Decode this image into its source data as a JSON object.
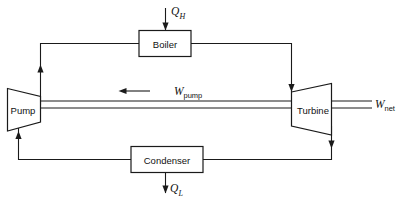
{
  "diagram": {
    "type": "thermodynamic-cycle-block-diagram",
    "background_color": "#ffffff",
    "line_color": "#1a1a1a"
  },
  "devices": {
    "boiler": {
      "label": "Boiler",
      "shape": "rectangle"
    },
    "turbine": {
      "label": "Turbine",
      "shape": "trapezoid-expanding-right"
    },
    "condenser": {
      "label": "Condenser",
      "shape": "rectangle"
    },
    "pump": {
      "label": "Pump",
      "shape": "trapezoid-narrowing-right"
    }
  },
  "flows": {
    "heat_in": {
      "symbol": "Q",
      "subscript": "H",
      "direction": "into-boiler-downward",
      "icon": "down-arrow-icon"
    },
    "heat_out": {
      "symbol": "Q",
      "subscript": "L",
      "direction": "out-of-condenser-downward",
      "icon": "down-arrow-icon"
    },
    "work_pump": {
      "symbol": "W",
      "subscript": "pump",
      "direction": "leftward-into-pump",
      "icon": "left-arrow-icon"
    },
    "work_net": {
      "symbol": "W",
      "subscript": "net",
      "direction": "rightward-out-of-turbine",
      "icon": "shaft-line-icon"
    }
  },
  "piping": {
    "pump_to_boiler": {
      "name": "feedwater-line",
      "arrow": "up-arrow-icon"
    },
    "boiler_to_turbine": {
      "name": "steam-line",
      "arrow": "down-arrow-icon"
    },
    "turbine_to_condenser": {
      "name": "exhaust-line",
      "arrow": "down-arrow-icon"
    },
    "condenser_to_pump": {
      "name": "condensate-line",
      "arrow": "up-arrow-icon"
    }
  }
}
